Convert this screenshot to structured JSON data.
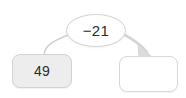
{
  "diagram": {
    "type": "function-machine",
    "start": {
      "label": "49",
      "fill_color": "#ededed",
      "border_color": "#d2d2d2"
    },
    "operation": {
      "label": "−21",
      "fill_color": "#ffffff",
      "border_color": "#d4d4d4"
    },
    "result": {
      "label": "",
      "fill_color": "#ffffff",
      "border_color": "#d9d9d9"
    },
    "connectors": {
      "input_line": {
        "name": "start-to-operation-curve",
        "has_arrowhead": false,
        "stroke_color": "#cfcfcf"
      },
      "output_arrow": {
        "name": "operation-to-result-arrow",
        "has_arrowhead": true,
        "stroke_color": "#d5d5d5"
      }
    },
    "background_color": "#ffffff"
  }
}
